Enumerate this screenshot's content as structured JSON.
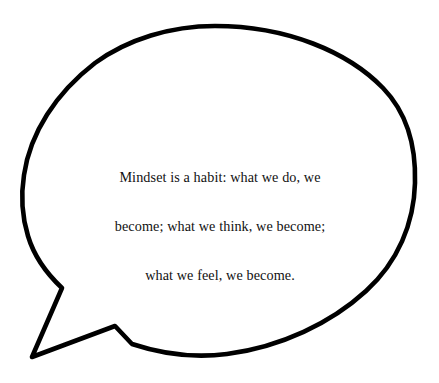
{
  "canvas": {
    "width": 439,
    "height": 383,
    "background_color": "#ffffff"
  },
  "bubble": {
    "name": "speech-bubble",
    "shape": "ellipse-with-angular-tail",
    "stroke_color": "#000000",
    "fill_color": "#ffffff",
    "stroke_width": 4.5,
    "tail_direction": "down-left",
    "tail_tip": {
      "x": 32,
      "y": 357
    },
    "tail_bend": {
      "x": 62,
      "y": 288
    },
    "tail_base": {
      "x": 115,
      "y": 326
    },
    "bounds": {
      "left": 22,
      "top": 25,
      "right": 416,
      "bottom": 357
    }
  },
  "quote": {
    "full_text": "Mindset is a habit: what we do, we become; what we think, we become; what we feel, we become.",
    "lines": [
      "Mindset is a habit: what we do, we",
      "become; what we think, we become;",
      "what we feel, we become."
    ],
    "text_color": "#111111",
    "align": "center"
  }
}
